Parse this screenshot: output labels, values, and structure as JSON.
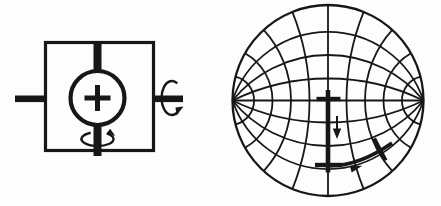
{
  "figure": {
    "background": "#fdfdfd",
    "ink": "#171717",
    "panels": {
      "device": {
        "name": "crystal-holder-schematic",
        "center_symbol": "+",
        "glyphs": [
          "holder-box",
          "crystal-circle",
          "plus-symbol",
          "top-shaft",
          "bottom-shaft",
          "left-shaft",
          "right-shaft",
          "vertical-axis-rotation-arrow",
          "horizontal-axis-rotation-arrow"
        ]
      },
      "stereonet": {
        "name": "wulff-net-projection",
        "glyphs": [
          "primitive-circle",
          "great-circle-arcs",
          "small-circle-arcs",
          "start-cross",
          "down-arrow",
          "intermediate-cross",
          "pole-path-arc",
          "path-arc-arrowhead",
          "end-cross"
        ]
      }
    }
  }
}
